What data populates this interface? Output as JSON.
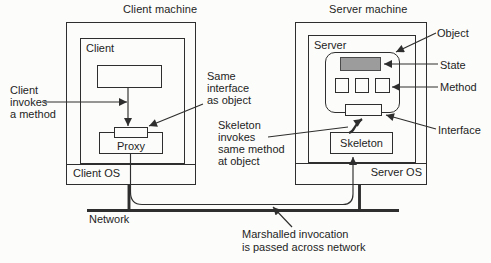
{
  "colors": {
    "line": "#2e2e2e",
    "text": "#1e1e1e",
    "state_fill": "#9c9c9c",
    "state_border": "#4a4a4a",
    "background": "#fcfcfa"
  },
  "client_machine": {
    "title": "Client machine",
    "client_box_label": "Client",
    "proxy_label": "Proxy",
    "os_label": "Client OS"
  },
  "server_machine": {
    "title": "Server machine",
    "server_box_label": "Server",
    "skeleton_label": "Skeleton",
    "os_label": "Server OS"
  },
  "annotations": {
    "client_invokes": "Client\ninvokes\na method",
    "same_interface": "Same\ninterface\nas object",
    "skeleton_invokes": "Skeleton\ninvokes\nsame method\nat object",
    "object": "Object",
    "state": "State",
    "method": "Method",
    "interface": "Interface",
    "network": "Network",
    "marshalled": "Marshalled invocation\nis passed across network"
  }
}
